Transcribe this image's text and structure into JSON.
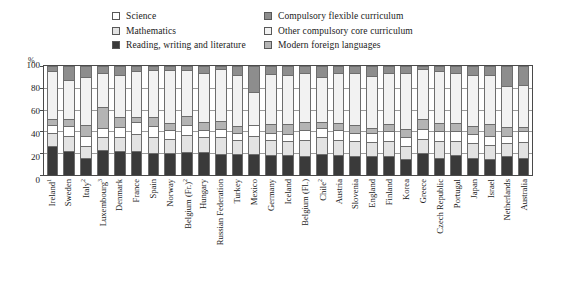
{
  "legend": {
    "left": [
      {
        "label": "Science",
        "key": "science",
        "color": "#ffffff"
      },
      {
        "label": "Mathematics",
        "key": "mathematics",
        "color": "#e3e3e3"
      },
      {
        "label": "Reading, writing and literature",
        "key": "reading",
        "color": "#3a3a3a"
      }
    ],
    "right": [
      {
        "label": "Compulsory flexible curriculum",
        "key": "flexible",
        "color": "#8d8d8d"
      },
      {
        "label": "Other compulsory core curriculum",
        "key": "other_core",
        "color": "#f2f2f2"
      },
      {
        "label": "Modern foreign languages",
        "key": "languages",
        "color": "#b4b4b4"
      }
    ]
  },
  "chart_data": {
    "type": "bar",
    "subtype": "stacked-bar-100",
    "title": "",
    "xlabel": "",
    "ylabel": "%",
    "ylim": [
      0,
      100
    ],
    "yticks": [
      0,
      20,
      40,
      60,
      80,
      100
    ],
    "grid": true,
    "legend_position": "top",
    "stack_order_bottom_to_top": [
      "reading",
      "mathematics",
      "science",
      "languages",
      "other_core",
      "flexible"
    ],
    "series_colors": {
      "reading": "#3a3a3a",
      "mathematics": "#e3e3e3",
      "science": "#ffffff",
      "languages": "#b4b4b4",
      "other_core": "#f2f2f2",
      "flexible": "#8d8d8d"
    },
    "series_names": {
      "reading": "Reading, writing and literature",
      "mathematics": "Mathematics",
      "science": "Science",
      "languages": "Modern foreign languages",
      "other_core": "Other compulsory core curriculum",
      "flexible": "Compulsory flexible curriculum"
    },
    "categories": [
      "Ireland",
      "Sweden",
      "Italy",
      "Luxembourg",
      "Denmark",
      "France",
      "Spain",
      "Norway",
      "Belgium (Fr.)",
      "Hungary",
      "Russian Federation",
      "Turkey",
      "Mexico",
      "Germany",
      "Iceland",
      "Belgium (Fl.)",
      "Chile",
      "Austria",
      "Slovenia",
      "England",
      "Finland",
      "Korea",
      "Greece",
      "Czech Republic",
      "Portugal",
      "Japan",
      "Israel",
      "Netherlands",
      "Australia"
    ],
    "category_footnotes": {
      "Ireland": "1",
      "Italy": "2",
      "Luxembourg": "3",
      "Belgium (Fr.)": "2",
      "Chile": "2"
    },
    "series": [
      {
        "name": "Reading, writing and literature",
        "key": "reading",
        "values": [
          27,
          22,
          16,
          23,
          22,
          22,
          20,
          20,
          21,
          21,
          19,
          19,
          19,
          18,
          18,
          17,
          19,
          18,
          17,
          17,
          17,
          15,
          20,
          16,
          18,
          16,
          15,
          17,
          16
        ]
      },
      {
        "name": "Mathematics",
        "key": "mathematics",
        "values": [
          12,
          14,
          11,
          12,
          13,
          16,
          15,
          13,
          16,
          14,
          16,
          13,
          17,
          14,
          13,
          15,
          16,
          14,
          14,
          13,
          14,
          12,
          13,
          15,
          13,
          13,
          13,
          12,
          14
        ]
      },
      {
        "name": "Science",
        "key": "science",
        "values": [
          7,
          9,
          9,
          8,
          9,
          11,
          10,
          8,
          9,
          6,
          7,
          7,
          10,
          7,
          7,
          9,
          8,
          9,
          8,
          9,
          9,
          8,
          9,
          9,
          9,
          9,
          8,
          7,
          10
        ]
      },
      {
        "name": "Modern foreign languages",
        "key": "languages",
        "values": [
          5,
          6,
          10,
          19,
          9,
          4,
          8,
          7,
          8,
          8,
          8,
          6,
          0,
          8,
          9,
          8,
          6,
          7,
          7,
          4,
          7,
          7,
          9,
          8,
          8,
          7,
          11,
          8,
          4
        ]
      },
      {
        "name": "Other compulsory core curriculum",
        "key": "other_core",
        "values": [
          44,
          36,
          44,
          32,
          39,
          42,
          43,
          48,
          42,
          45,
          47,
          47,
          30,
          46,
          45,
          45,
          41,
          46,
          48,
          48,
          47,
          52,
          46,
          47,
          46,
          47,
          45,
          38,
          39
        ]
      },
      {
        "name": "Compulsory flexible curriculum",
        "key": "flexible",
        "values": [
          5,
          13,
          10,
          6,
          8,
          5,
          4,
          4,
          4,
          6,
          3,
          8,
          24,
          7,
          8,
          6,
          10,
          6,
          6,
          9,
          6,
          6,
          3,
          5,
          6,
          8,
          8,
          18,
          17
        ]
      }
    ]
  }
}
